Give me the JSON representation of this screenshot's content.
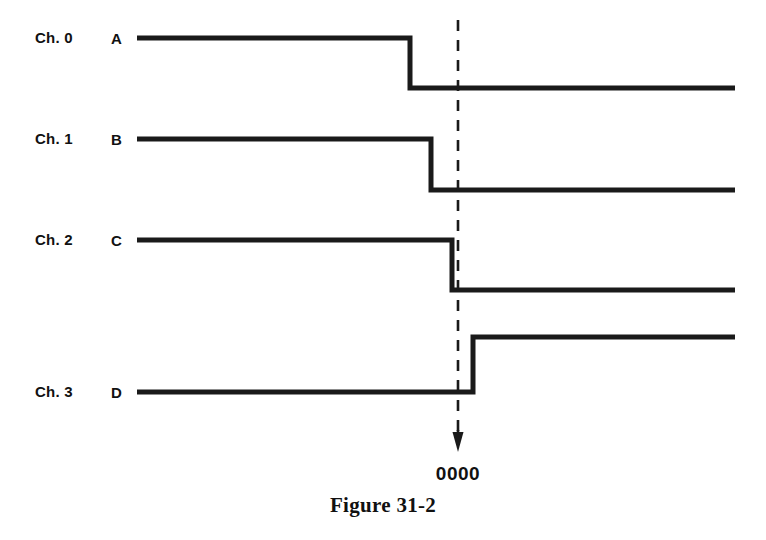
{
  "figure": {
    "caption": "Figure 31-2",
    "marker_label": "0000",
    "background_color": "#ffffff",
    "line_color": "#1a1a1a"
  },
  "channels": [
    {
      "channel_label": "Ch. 0",
      "signal_label": "A",
      "initial_level": "high",
      "final_level": "low",
      "transition": "falling",
      "transition_x": 410,
      "high_y": 38,
      "low_y": 88,
      "start_x": 137,
      "end_x": 735
    },
    {
      "channel_label": "Ch. 1",
      "signal_label": "B",
      "initial_level": "high",
      "final_level": "low",
      "transition": "falling",
      "transition_x": 431,
      "high_y": 139,
      "low_y": 190,
      "start_x": 137,
      "end_x": 735
    },
    {
      "channel_label": "Ch. 2",
      "signal_label": "C",
      "initial_level": "high",
      "final_level": "low",
      "transition": "falling",
      "transition_x": 452,
      "high_y": 240,
      "low_y": 290,
      "start_x": 137,
      "end_x": 735
    },
    {
      "channel_label": "Ch. 3",
      "signal_label": "D",
      "initial_level": "low",
      "final_level": "high",
      "transition": "rising",
      "transition_x": 473,
      "high_y": 337,
      "low_y": 392,
      "start_x": 137,
      "end_x": 735
    }
  ],
  "marker": {
    "x": 458,
    "top_y": 20,
    "arrow_tip_y": 452,
    "style": "dashed-vertical-with-down-arrow"
  },
  "label_rows": [
    {
      "chan_top": 30,
      "sig_top": 31
    },
    {
      "chan_top": 131,
      "sig_top": 132
    },
    {
      "chan_top": 232,
      "sig_top": 233
    },
    {
      "chan_top": 384,
      "sig_top": 385
    }
  ]
}
